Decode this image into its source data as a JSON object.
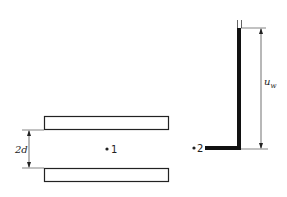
{
  "diagram": {
    "labels": {
      "gap": "2d",
      "point1": "1",
      "point2": "2",
      "wall_velocity": "u",
      "wall_velocity_sub": "w"
    },
    "colors": {
      "ink": "#222222",
      "background": "#ffffff"
    }
  }
}
